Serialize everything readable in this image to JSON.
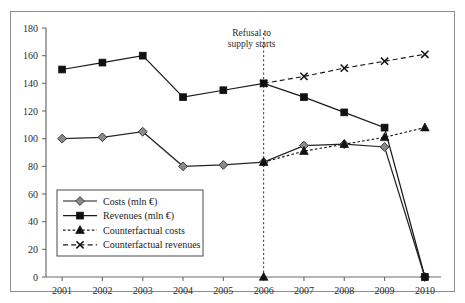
{
  "chart_data": {
    "type": "line",
    "title": "",
    "subtitle": "",
    "xlabel": "",
    "ylabel": "",
    "x": [
      2001,
      2002,
      2003,
      2004,
      2005,
      2006,
      2007,
      2008,
      2009,
      2010
    ],
    "categories": [
      "2001",
      "2002",
      "2003",
      "2004",
      "2005",
      "2006",
      "2007",
      "2008",
      "2009",
      "2010"
    ],
    "xlim": [
      2000.6,
      2010.4
    ],
    "ylim": [
      0,
      180
    ],
    "yticks": [
      0,
      20,
      40,
      60,
      80,
      100,
      120,
      140,
      160,
      180
    ],
    "ytick_labels": [
      "0",
      "20",
      "40",
      "60",
      "80",
      "100",
      "120",
      "140",
      "160",
      "180"
    ],
    "xticks": [
      2001,
      2002,
      2003,
      2004,
      2005,
      2006,
      2007,
      2008,
      2009,
      2010
    ],
    "xtick_labels": [
      "2001",
      "2002",
      "2003",
      "2004",
      "2005",
      "2006",
      "2007",
      "2008",
      "2009",
      "2010"
    ],
    "grid": false,
    "legend_position": "lower-left-inside",
    "series": [
      {
        "name": "Costs (mln €)",
        "key": "costs",
        "marker": "diamond",
        "linestyle": "solid",
        "color": "#262626",
        "marker_fill": "#8a8a8a",
        "x": [
          2001,
          2002,
          2003,
          2004,
          2005,
          2006,
          2007,
          2008,
          2009,
          2010
        ],
        "values": [
          100,
          101,
          105,
          80,
          81,
          83,
          95,
          96,
          94,
          0
        ]
      },
      {
        "name": "Revenues (mln €)",
        "key": "revenues",
        "marker": "square",
        "linestyle": "solid",
        "color": "#1a1a1a",
        "marker_fill": "#111111",
        "x": [
          2001,
          2002,
          2003,
          2004,
          2005,
          2006,
          2007,
          2008,
          2009,
          2010
        ],
        "values": [
          150,
          155,
          160,
          130,
          135,
          140,
          130,
          119,
          108,
          0
        ]
      },
      {
        "name": "Counterfactual costs",
        "key": "counterfactual_costs",
        "marker": "triangle",
        "linestyle": "dotted",
        "color": "#1a1a1a",
        "marker_fill": "#111111",
        "x": [
          2006,
          2007,
          2008,
          2009,
          2010
        ],
        "values": [
          83,
          91,
          96,
          101,
          108
        ]
      },
      {
        "name": "Counterfactual revenues",
        "key": "counterfactual_revenues",
        "marker": "cross",
        "linestyle": "dashed",
        "color": "#1a1a1a",
        "marker_fill": "#111111",
        "x": [
          2006,
          2007,
          2008,
          2009,
          2010
        ],
        "values": [
          140,
          145,
          151,
          156,
          161
        ]
      }
    ],
    "annotations": [
      {
        "key": "refusal",
        "line1": "Refusal to",
        "line2": "supply starts",
        "x": 2006,
        "vline": true,
        "vline_style": "dotted",
        "marker_at_axis": "triangle"
      }
    ]
  },
  "legend": {
    "items": [
      {
        "label": "Costs (mln €)",
        "marker": "diamond",
        "linestyle": "solid"
      },
      {
        "label": "Revenues (mln €)",
        "marker": "square",
        "linestyle": "solid"
      },
      {
        "label": "Counterfactual costs",
        "marker": "triangle",
        "linestyle": "dotted"
      },
      {
        "label": "Counterfactual revenues",
        "marker": "cross",
        "linestyle": "dashed"
      }
    ]
  },
  "colors": {
    "axis": "#6b6b6b",
    "text": "#2b2b2b",
    "frame": "#8d8d8d",
    "series_dark": "#1a1a1a",
    "diamond_fill": "#8a8a8a",
    "background": "#ffffff"
  }
}
